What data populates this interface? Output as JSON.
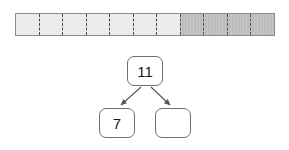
{
  "figure": {
    "bar": {
      "segment_count": 11,
      "light_segment_count": 7,
      "dark_segment_count": 4,
      "light_color": "#ececec",
      "dark_color": "#bcbcbc",
      "border_color": "#8c8c8c",
      "divider_color": "#4d4d4d",
      "segments": [
        {
          "index": 1,
          "shade": "light"
        },
        {
          "index": 2,
          "shade": "light"
        },
        {
          "index": 3,
          "shade": "light"
        },
        {
          "index": 4,
          "shade": "light"
        },
        {
          "index": 5,
          "shade": "light"
        },
        {
          "index": 6,
          "shade": "light"
        },
        {
          "index": 7,
          "shade": "light"
        },
        {
          "index": 8,
          "shade": "dark"
        },
        {
          "index": 9,
          "shade": "dark"
        },
        {
          "index": 10,
          "shade": "dark"
        },
        {
          "index": 11,
          "shade": "dark"
        }
      ]
    },
    "tree": {
      "root": {
        "label": "11"
      },
      "left_child": {
        "label": "7"
      },
      "right_child": {
        "label": ""
      },
      "node_border_color": "#6e6e6e",
      "node_fill_color": "#ffffff",
      "edge_color": "#555555"
    }
  }
}
